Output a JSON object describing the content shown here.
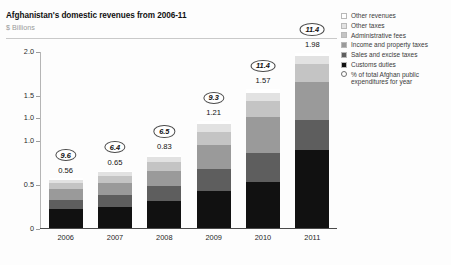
{
  "header": {
    "title": "Afghanistan's domestic revenues from 2006-11",
    "subtitle": "$ Billions"
  },
  "legend": {
    "items": [
      {
        "label": "Other revenues",
        "color": "#ffffff",
        "shape": "square"
      },
      {
        "label": "Other taxes",
        "color": "#e2e2e2",
        "shape": "square"
      },
      {
        "label": "Administrative fees",
        "color": "#c4c4c4",
        "shape": "square"
      },
      {
        "label": "Income and property taxes",
        "color": "#9a9a9a",
        "shape": "square"
      },
      {
        "label": "Sales and excise taxes",
        "color": "#5e5e5e",
        "shape": "square"
      },
      {
        "label": "Customs duties",
        "color": "#111111",
        "shape": "square"
      },
      {
        "label": "% of total Afghan public expenditures for year",
        "color": "#ffffff",
        "shape": "circle"
      }
    ]
  },
  "chart_data": {
    "type": "bar",
    "title": "Afghanistan's domestic revenues from 2006-11",
    "subtitle": "$ Billions",
    "xlabel": "",
    "ylabel": "$ Billions",
    "ylim": [
      0,
      2.0
    ],
    "ytick_labels": [
      "0",
      "0.5",
      "1.0",
      "1.0",
      "1.5",
      "2.0"
    ],
    "ytick_values": [
      0,
      0.5,
      1.0,
      1.25,
      1.5,
      2.0
    ],
    "grid": false,
    "legend_position": "right",
    "categories": [
      "2006",
      "2007",
      "2008",
      "2009",
      "2010",
      "2011"
    ],
    "totals": [
      0.56,
      0.65,
      0.83,
      1.21,
      1.57,
      1.98
    ],
    "total_labels": [
      "0.56",
      "0.65",
      "0.83",
      "1.21",
      "1.57",
      "1.98"
    ],
    "annotations": {
      "name": "% of total Afghan public expenditures for year",
      "labels": [
        "9.6",
        "6.4",
        "6.5",
        "9.3",
        "11.4",
        "11.4"
      ],
      "values": [
        9.6,
        6.4,
        6.5,
        9.3,
        11.4,
        11.4
      ]
    },
    "series": [
      {
        "name": "Customs duties",
        "color": "#111111",
        "values": [
          0.21,
          0.24,
          0.3,
          0.42,
          0.52,
          0.88
        ]
      },
      {
        "name": "Sales and excise taxes",
        "color": "#5e5e5e",
        "values": [
          0.11,
          0.13,
          0.17,
          0.25,
          0.33,
          0.34
        ]
      },
      {
        "name": "Income and property taxes",
        "color": "#9a9a9a",
        "values": [
          0.12,
          0.14,
          0.18,
          0.27,
          0.41,
          0.43
        ]
      },
      {
        "name": "Administrative fees",
        "color": "#c4c4c4",
        "values": [
          0.07,
          0.08,
          0.1,
          0.15,
          0.18,
          0.2
        ]
      },
      {
        "name": "Other taxes",
        "color": "#e2e2e2",
        "values": [
          0.03,
          0.04,
          0.05,
          0.08,
          0.09,
          0.09
        ]
      },
      {
        "name": "Other revenues",
        "color": "#ffffff",
        "values": [
          0.02,
          0.02,
          0.03,
          0.04,
          0.04,
          0.04
        ]
      }
    ]
  }
}
